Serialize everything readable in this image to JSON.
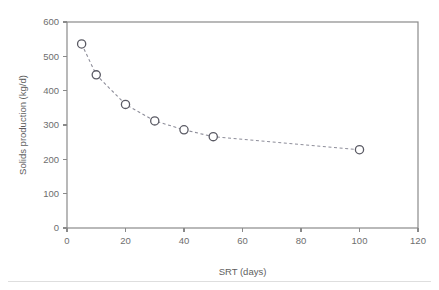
{
  "figure": {
    "background_color": "#ffffff",
    "frame_color": "#8a8a8a",
    "bottom_rule_color": "#dedede"
  },
  "chart_data": {
    "type": "scatter",
    "title": "",
    "subtitle": "",
    "xlabel": "SRT (days)",
    "ylabel": "Solids production (kg/d)",
    "xlim": [
      0,
      120
    ],
    "ylim": [
      0,
      600
    ],
    "xticks": [
      0,
      20,
      40,
      60,
      80,
      100,
      120
    ],
    "yticks": [
      0,
      100,
      200,
      300,
      400,
      500,
      600
    ],
    "xtick_labels": [
      "0",
      "20",
      "40",
      "60",
      "80",
      "100",
      "120"
    ],
    "ytick_labels": [
      "0",
      "100",
      "200",
      "300",
      "400",
      "500",
      "600"
    ],
    "grid": false,
    "legend": null,
    "legend_position": "none",
    "marker_style": "open-circle",
    "marker_face_color": "#ffffff",
    "marker_edge_color": "#5a5a64",
    "line_style": "dashed",
    "line_color": "#8e8e9a",
    "x": [
      5,
      10,
      20,
      30,
      40,
      50,
      100
    ],
    "values": [
      536,
      446,
      360,
      312,
      286,
      266,
      228
    ],
    "series": [
      {
        "name": "Solids production",
        "x": [
          5,
          10,
          20,
          30,
          40,
          50,
          100
        ],
        "values": [
          536,
          446,
          360,
          312,
          286,
          266,
          228
        ]
      }
    ],
    "points": [
      {
        "x": 5,
        "y": 536
      },
      {
        "x": 10,
        "y": 446
      },
      {
        "x": 20,
        "y": 360
      },
      {
        "x": 30,
        "y": 312
      },
      {
        "x": 40,
        "y": 286
      },
      {
        "x": 50,
        "y": 266
      },
      {
        "x": 100,
        "y": 228
      }
    ]
  }
}
